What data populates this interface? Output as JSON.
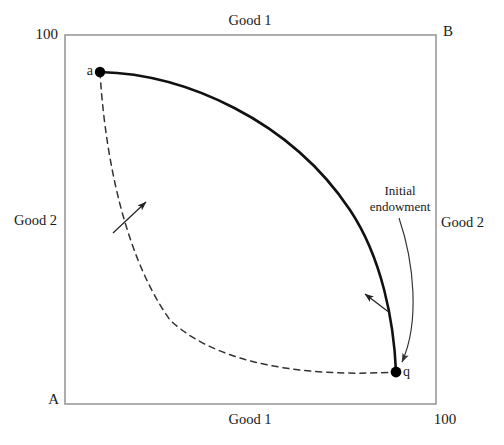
{
  "figure": {
    "type": "edgeworth-box-diagram",
    "width": 504,
    "height": 445,
    "background": "#ffffff",
    "box": {
      "left": 65,
      "top": 35,
      "right": 436,
      "bottom": 404,
      "border_color": "#9a9a9a",
      "border_width": 1.6
    }
  },
  "labels": {
    "top_axis": "Good 1",
    "bottom_axis": "Good 1",
    "left_axis": "Good 2",
    "right_axis": "Good 2",
    "top_left_tick": "100",
    "bottom_right_tick": "100",
    "origin_a_corner": "A",
    "origin_b_corner": "B",
    "point_a": "a",
    "point_q": "q",
    "annotation": "Initial\nendowment",
    "annotation_line1": "Initial",
    "annotation_line2": "endowment"
  },
  "colors": {
    "curve_solid": "#111111",
    "curve_dashed": "#333333",
    "annotation_arrow": "#333333",
    "box_border": "#9a9a9a",
    "point_fill": "#000000",
    "text": "#1a1a1a"
  },
  "chart_data": {
    "type": "line",
    "title": "",
    "subtitle": "",
    "xlabel": "Good 1",
    "ylabel": "Good 2",
    "xlim": [
      0,
      100
    ],
    "ylim": [
      0,
      100
    ],
    "grid": false,
    "legend": null,
    "axes": {
      "bottom_left_origin_label": "A",
      "top_right_origin_label": "B",
      "bottom_axis_label": "Good 1",
      "top_axis_label": "Good 1",
      "left_axis_label": "Good 2",
      "right_axis_label": "Good 2",
      "bottom_axis_ticks": [
        "100"
      ],
      "left_axis_ticks": [
        "100"
      ]
    },
    "points": [
      {
        "name": "a",
        "label": "a",
        "x": 9.4,
        "y": 90.0,
        "px": 100,
        "py": 72
      },
      {
        "name": "q",
        "label": "q",
        "x": 89.2,
        "y": 8.7,
        "px": 396,
        "py": 372
      }
    ],
    "series": [
      {
        "name": "contract-curve-solid",
        "style": "solid",
        "width": 2.6,
        "color": "#111111",
        "description": "Bold curve from a to q bulging toward the upper-right (B corner)",
        "path_px": "M100,72 C185,74 290,120 350,210 C382,258 394,322 396,372"
      },
      {
        "name": "indifference-curve-dashed",
        "style": "dashed",
        "width": 1.5,
        "color": "#333333",
        "dash": "6,5",
        "description": "Dashed curve from a to q bulging toward the lower-left (A corner)",
        "path_px": "M100,72 C104,140 120,250 170,320 C225,372 330,376 396,372"
      }
    ],
    "annotations": [
      {
        "name": "initial-endowment",
        "text": "Initial endowment",
        "text_px": {
          "x": 400,
          "y": 196
        },
        "arrow": "curved",
        "arrow_from_px": {
          "x": 399,
          "y": 218
        },
        "arrow_to_px": {
          "x": 398,
          "y": 366
        }
      },
      {
        "name": "dashed-curve-pointer",
        "text": "",
        "arrow": "straight",
        "arrow_from_px": {
          "x": 113,
          "y": 233
        },
        "arrow_to_px": {
          "x": 146,
          "y": 202
        }
      },
      {
        "name": "solid-curve-pointer",
        "text": "",
        "arrow": "straight",
        "arrow_from_px": {
          "x": 390,
          "y": 313
        },
        "arrow_to_px": {
          "x": 365,
          "y": 294
        }
      }
    ]
  }
}
